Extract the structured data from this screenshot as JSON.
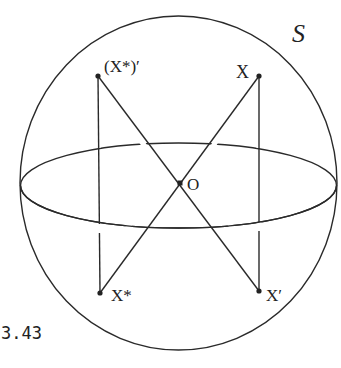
{
  "figure": {
    "sphere_label": "S",
    "center_label": "O",
    "caption": "3.43",
    "points": [
      {
        "id": "x",
        "label": "X",
        "x": 259,
        "y": 76
      },
      {
        "id": "x-star-prime",
        "label": "(X*)′",
        "x": 98,
        "y": 76
      },
      {
        "id": "x-star",
        "label": "X*",
        "x": 100,
        "y": 293
      },
      {
        "id": "x-prime",
        "label": "X′",
        "x": 259,
        "y": 291
      }
    ],
    "center": {
      "x": 180,
      "y": 183
    },
    "colors": {
      "ink": "#2a2a2a",
      "background": "#ffffff"
    }
  }
}
